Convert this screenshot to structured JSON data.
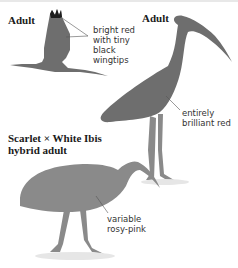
{
  "panels": [
    {
      "heading": "Adult",
      "label_lines": [
        "bright red",
        "with tiny",
        "black",
        "wingtips"
      ],
      "pose": "flying"
    },
    {
      "heading": "Adult",
      "label_lines": [
        "entirely",
        "brilliant red"
      ],
      "pose": "standing"
    },
    {
      "heading_lines": [
        "Scarlet × White Ibis",
        "hybrid adult"
      ],
      "label_lines": [
        "variable",
        "rosy-pink"
      ],
      "pose": "foraging"
    }
  ],
  "colors": {
    "body_fill": "#6e6e6e",
    "hybrid_fill": "#8a8a8a",
    "wingtip": "#1e1e1e",
    "leader_line": "#555555",
    "shadow": "#e6e6e6"
  }
}
